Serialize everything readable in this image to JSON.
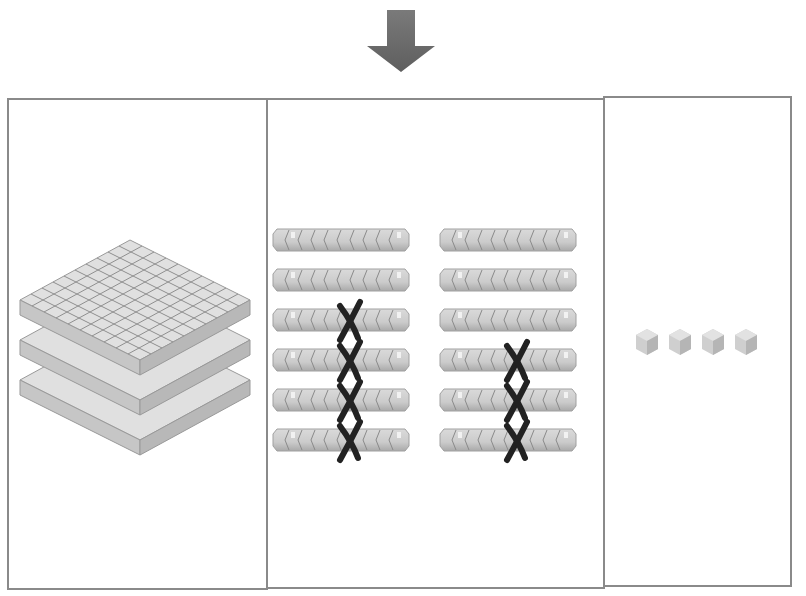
{
  "diagram": {
    "type": "base-ten-blocks",
    "arrow": {
      "direction": "down",
      "color": "#6b6b6b"
    },
    "colors": {
      "block_face": "#d4d4d4",
      "block_edge": "#8f8f8f",
      "panel_border": "#8a8a8a",
      "cross": "#222222"
    },
    "panels": [
      {
        "name": "hundreds",
        "block": "flat",
        "count": 3,
        "crossed": 0
      },
      {
        "name": "tens",
        "block": "rod",
        "count": 12,
        "columns": 2,
        "rows": 6,
        "crossed_positions": [
          {
            "col": 0,
            "row": 2
          },
          {
            "col": 0,
            "row": 3
          },
          {
            "col": 0,
            "row": 4
          },
          {
            "col": 0,
            "row": 5
          },
          {
            "col": 1,
            "row": 3
          },
          {
            "col": 1,
            "row": 4
          },
          {
            "col": 1,
            "row": 5
          }
        ],
        "crossed": 7
      },
      {
        "name": "ones",
        "block": "unit-cube",
        "count": 4,
        "crossed": 0
      }
    ]
  }
}
